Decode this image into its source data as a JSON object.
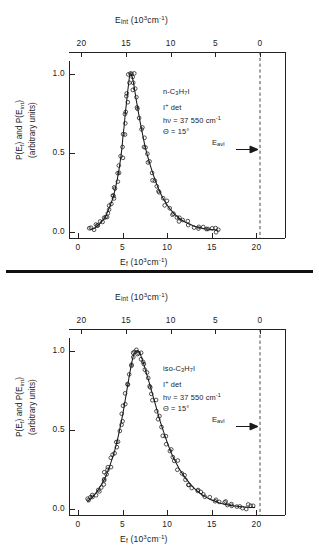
{
  "figure": {
    "divider_name": "panel-divider"
  },
  "axes": {
    "top_title_main": "E",
    "top_title_sub": "int",
    "top_title_units_pre": " (10",
    "top_title_units_sup": "3",
    "top_title_units_post": "cm",
    "top_title_units_sup2": "-1",
    "top_title_units_close": ")",
    "bottom_title_main": "E",
    "bottom_title_sub": "f",
    "y_title_line1_a": "P(E",
    "y_title_line1_sub1": "f",
    "y_title_line1_b": ") and P(E",
    "y_title_line1_sub2": "int",
    "y_title_line1_c": ")",
    "y_title_line2": "(arbitrary units)",
    "top_ticks": [
      "20",
      "15",
      "10",
      "5",
      "0"
    ],
    "top_tick_values": [
      20,
      15,
      10,
      5,
      0
    ],
    "bottom_ticks": [
      "0",
      "5",
      "10",
      "15",
      "20"
    ],
    "bottom_tick_values": [
      0,
      5,
      10,
      15,
      20
    ],
    "y_ticks": [
      "1.0",
      "0.5",
      "0.0"
    ],
    "y_tick_values": [
      1.0,
      0.5,
      0.0
    ],
    "xlim": [
      -1.0,
      23.2
    ],
    "ylim": [
      -0.04,
      1.08
    ],
    "e_avl_value": 20.4
  },
  "panels": [
    {
      "id": "panel-top",
      "name": "n-propyl-iodide-panel",
      "annotation": {
        "molecule_pre": "n-C",
        "molecule_sub1": "3",
        "molecule_mid": "H",
        "molecule_sub2": "7",
        "molecule_post": "I",
        "detection_pre": "I",
        "detection_sup": "+",
        "detection_post": " det",
        "photon_pre": "hν = 37 550 cm",
        "photon_sup": "-1",
        "angle": "Θ = 15°"
      },
      "e_avl_label_pre": "E",
      "e_avl_label_sub": "avl",
      "chart_data": {
        "type": "scatter",
        "title": "n-C3H7I photofragment translational energy distribution",
        "xlabel": "E_f (10^3 cm^-1)",
        "xlabel_top": "E_int (10^3 cm^-1)",
        "ylabel": "P(E_f) and P(E_int) (arbitrary units)",
        "xlim": [
          -1.0,
          23.2
        ],
        "ylim": [
          -0.04,
          1.08
        ],
        "grid": false,
        "legend": "none",
        "e_avl": 20.4,
        "peak_x": 5.8,
        "peak_y": 1.0,
        "x": [
          1.4,
          1.8,
          2.1,
          2.4,
          2.6,
          2.9,
          3.1,
          3.3,
          3.5,
          3.7,
          3.9,
          4.05,
          4.2,
          4.35,
          4.5,
          4.65,
          4.8,
          4.95,
          5.05,
          5.2,
          5.3,
          5.45,
          5.55,
          5.7,
          5.8,
          5.95,
          6.05,
          6.2,
          6.35,
          6.5,
          6.7,
          6.9,
          7.1,
          7.3,
          7.5,
          7.75,
          8.0,
          8.3,
          8.6,
          8.9,
          9.2,
          9.5,
          9.85,
          10.2,
          10.6,
          11.0,
          11.4,
          11.9,
          12.4,
          12.9,
          13.4,
          13.9,
          14.4,
          14.9,
          15.3,
          15.7
        ],
        "y": [
          0.012,
          0.02,
          0.032,
          0.048,
          0.062,
          0.08,
          0.1,
          0.122,
          0.15,
          0.178,
          0.21,
          0.24,
          0.275,
          0.315,
          0.36,
          0.41,
          0.47,
          0.54,
          0.605,
          0.68,
          0.745,
          0.82,
          0.875,
          0.945,
          0.99,
          1.0,
          0.985,
          0.95,
          0.9,
          0.845,
          0.78,
          0.715,
          0.655,
          0.6,
          0.545,
          0.49,
          0.44,
          0.385,
          0.335,
          0.29,
          0.25,
          0.215,
          0.182,
          0.152,
          0.125,
          0.102,
          0.082,
          0.064,
          0.05,
          0.038,
          0.029,
          0.022,
          0.017,
          0.013,
          0.011,
          0.009
        ]
      }
    },
    {
      "id": "panel-bottom",
      "name": "iso-propyl-iodide-panel",
      "annotation": {
        "molecule_pre": "iso-C",
        "molecule_sub1": "3",
        "molecule_mid": "H",
        "molecule_sub2": "7",
        "molecule_post": "I",
        "detection_pre": "I",
        "detection_sup": "+",
        "detection_post": " det",
        "photon_pre": "hν = 37 550 cm",
        "photon_sup": "-1",
        "angle": "Θ = 15°"
      },
      "e_avl_label_pre": "E",
      "e_avl_label_sub": "avl",
      "chart_data": {
        "type": "scatter",
        "title": "iso-C3H7I photofragment translational energy distribution",
        "xlabel": "E_f (10^3 cm^-1)",
        "xlabel_top": "E_int (10^3 cm^-1)",
        "ylabel": "P(E_f) and P(E_int) (arbitrary units)",
        "xlim": [
          -1.0,
          23.2
        ],
        "ylim": [
          -0.04,
          1.08
        ],
        "grid": false,
        "legend": "none",
        "e_avl": 20.4,
        "peak_x": 6.6,
        "peak_y": 1.0,
        "x": [
          1.1,
          1.4,
          1.7,
          2.0,
          2.25,
          2.5,
          2.75,
          3.0,
          3.2,
          3.4,
          3.6,
          3.8,
          4.0,
          4.2,
          4.4,
          4.6,
          4.8,
          5.0,
          5.2,
          5.4,
          5.6,
          5.8,
          6.0,
          6.2,
          6.4,
          6.6,
          6.8,
          7.0,
          7.2,
          7.4,
          7.6,
          7.85,
          8.1,
          8.35,
          8.6,
          8.85,
          9.1,
          9.4,
          9.7,
          10.0,
          10.3,
          10.6,
          10.95,
          11.3,
          11.7,
          12.1,
          12.5,
          12.9,
          13.35,
          13.8,
          14.3,
          14.8,
          15.3,
          15.8,
          16.3,
          16.8,
          17.3,
          17.8,
          18.3,
          18.8,
          19.3,
          19.8
        ],
        "y": [
          0.045,
          0.06,
          0.078,
          0.098,
          0.118,
          0.14,
          0.165,
          0.19,
          0.215,
          0.245,
          0.275,
          0.31,
          0.345,
          0.385,
          0.43,
          0.48,
          0.535,
          0.59,
          0.655,
          0.72,
          0.79,
          0.855,
          0.915,
          0.965,
          0.99,
          1.0,
          0.995,
          0.975,
          0.945,
          0.91,
          0.87,
          0.825,
          0.775,
          0.725,
          0.675,
          0.625,
          0.575,
          0.52,
          0.47,
          0.42,
          0.375,
          0.335,
          0.295,
          0.258,
          0.222,
          0.19,
          0.162,
          0.137,
          0.113,
          0.093,
          0.075,
          0.06,
          0.048,
          0.038,
          0.03,
          0.024,
          0.019,
          0.015,
          0.012,
          0.01,
          0.008,
          0.007
        ]
      }
    }
  ]
}
